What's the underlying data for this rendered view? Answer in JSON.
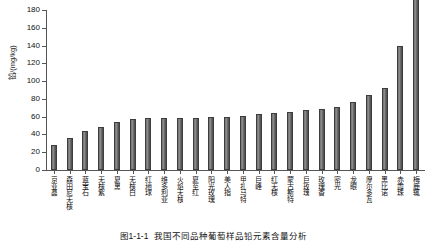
{
  "chart_data": {
    "type": "bar",
    "title": "",
    "caption_number": "图1-1-1",
    "caption_text": "我国不同品种葡萄样品铅元素含量分析",
    "xlabel": "",
    "ylabel": "铅/(mg/kg)",
    "ylim": [
      0,
      180
    ],
    "yticks": [
      0,
      20,
      40,
      60,
      80,
      100,
      120,
      140,
      160,
      180
    ],
    "grid": false,
    "legend": "none",
    "bar_color": "#6f6f6f",
    "categories": [
      "京亚晶",
      "森田尼无核",
      "蓝宝石",
      "无核紫",
      "夏黑",
      "无核白",
      "红地球",
      "维多利亚",
      "火焰无核",
      "夏至红",
      "阳光玫瑰",
      "美人指",
      "甲扎马特",
      "巨峰",
      "红无核",
      "蒙古斯特",
      "巨玫瑰",
      "玫瑰香",
      "密光",
      "龙眼",
      "摩尔多瓦",
      "黑比诺",
      "赤霞珠",
      "梅鹿辄"
    ],
    "values": [
      28,
      36,
      44,
      48,
      54,
      57,
      58,
      58,
      59,
      59,
      60,
      60,
      61,
      63,
      64,
      65,
      67,
      69,
      71,
      76,
      84,
      92,
      140,
      194
    ]
  }
}
